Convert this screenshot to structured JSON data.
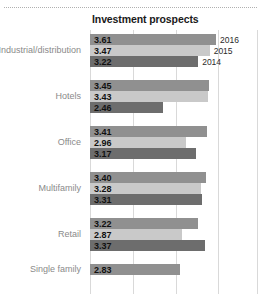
{
  "chart_title": "Investment prospects",
  "legend": {
    "labels": [
      "2016",
      "2015",
      "2014"
    ]
  },
  "colors": {
    "y2016": "#909090",
    "y2015": "#c9c9c9",
    "y2014": "#6d6d6d",
    "gridline": "#d9d9d9",
    "axis": "#bdbdbd",
    "category_label": "#8a8a8a",
    "value_label": "#111111",
    "title": "#1a1a1a",
    "top_rule": "#b0b0b0"
  },
  "chart_data": {
    "type": "bar",
    "orientation": "horizontal",
    "title": "Investment prospects",
    "xlabel": "",
    "ylabel": "",
    "grid": true,
    "legend_position": "inline-right-of-first-group",
    "xlim": [
      0.87,
      4.52
    ],
    "gridline_values": [
      0.87,
      1.8,
      2.73,
      3.66
    ],
    "categories": [
      "Industrial/distribution",
      "Hotels",
      "Office",
      "Multifamily",
      "Retail",
      "Single family"
    ],
    "series": [
      {
        "name": "2016",
        "values": [
          3.61,
          3.45,
          3.41,
          3.4,
          3.22,
          2.83
        ]
      },
      {
        "name": "2015",
        "values": [
          3.47,
          3.43,
          2.96,
          3.28,
          2.87,
          null
        ]
      },
      {
        "name": "2014",
        "values": [
          3.22,
          2.46,
          3.17,
          3.31,
          3.37,
          null
        ]
      }
    ]
  },
  "groups": [
    {
      "label": "Industrial/distribution",
      "bars": [
        {
          "year": "2016",
          "value": "3.61",
          "num": 3.61,
          "show_year": true
        },
        {
          "year": "2015",
          "value": "3.47",
          "num": 3.47,
          "show_year": true
        },
        {
          "year": "2014",
          "value": "3.22",
          "num": 3.22,
          "show_year": true
        }
      ]
    },
    {
      "label": "Hotels",
      "bars": [
        {
          "year": "2016",
          "value": "3.45",
          "num": 3.45,
          "show_year": false
        },
        {
          "year": "2015",
          "value": "3.43",
          "num": 3.43,
          "show_year": false
        },
        {
          "year": "2014",
          "value": "2.46",
          "num": 2.46,
          "show_year": false
        }
      ]
    },
    {
      "label": "Office",
      "bars": [
        {
          "year": "2016",
          "value": "3.41",
          "num": 3.41,
          "show_year": false
        },
        {
          "year": "2015",
          "value": "2.96",
          "num": 2.96,
          "show_year": false
        },
        {
          "year": "2014",
          "value": "3.17",
          "num": 3.17,
          "show_year": false
        }
      ]
    },
    {
      "label": "Multifamily",
      "bars": [
        {
          "year": "2016",
          "value": "3.40",
          "num": 3.4,
          "show_year": false
        },
        {
          "year": "2015",
          "value": "3.28",
          "num": 3.28,
          "show_year": false
        },
        {
          "year": "2014",
          "value": "3.31",
          "num": 3.31,
          "show_year": false
        }
      ]
    },
    {
      "label": "Retail",
      "bars": [
        {
          "year": "2016",
          "value": "3.22",
          "num": 3.22,
          "show_year": false
        },
        {
          "year": "2015",
          "value": "2.87",
          "num": 2.87,
          "show_year": false
        },
        {
          "year": "2014",
          "value": "3.37",
          "num": 3.37,
          "show_year": false
        }
      ]
    },
    {
      "label": "Single family",
      "bars": [
        {
          "year": "2016",
          "value": "2.83",
          "num": 2.83,
          "show_year": false
        }
      ]
    }
  ]
}
